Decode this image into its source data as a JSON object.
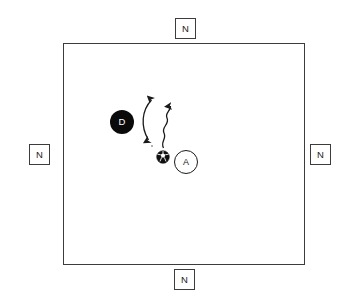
{
  "diagram": {
    "canvas": {
      "width": 346,
      "height": 308,
      "background": "#ffffff"
    },
    "field": {
      "label": "playing-area",
      "x": 63,
      "y": 43,
      "width": 242,
      "height": 222,
      "stroke": "#3c3c3c",
      "fill": "#ffffff"
    },
    "neutral_players": [
      {
        "label": "N",
        "position": "top",
        "x": 185,
        "y": 28
      },
      {
        "label": "N",
        "position": "left",
        "x": 39,
        "y": 154
      },
      {
        "label": "N",
        "position": "right",
        "x": 320,
        "y": 154
      },
      {
        "label": "N",
        "position": "bottom",
        "x": 184,
        "y": 279
      }
    ],
    "players": [
      {
        "label": "D",
        "role": "defender",
        "style": "filled-disc",
        "fill": "#0a0a0a",
        "text_color": "#ffffff",
        "x": 122,
        "y": 122,
        "radius": 12
      },
      {
        "label": "A",
        "role": "attacker",
        "style": "outlined-circle",
        "fill": "#ffffff",
        "text_color": "#1a1a1a",
        "x": 186,
        "y": 162,
        "radius": 12
      }
    ],
    "ball": {
      "name": "soccer-ball",
      "x": 163,
      "y": 157,
      "radius": 7,
      "fill": "#111111",
      "panel_color": "#ffffff"
    },
    "arrows": [
      {
        "name": "double-headed-curved-arrow",
        "meaning": "defender movement range",
        "style": "solid-curve",
        "heads": "both",
        "from": {
          "x": 147,
          "y": 145
        },
        "to": {
          "x": 153,
          "y": 96
        },
        "stroke": "#1a1a1a"
      },
      {
        "name": "wavy-dribble-arrow",
        "meaning": "ball dribble path",
        "style": "wavy",
        "heads": "end",
        "from": {
          "x": 164,
          "y": 150
        },
        "to": {
          "x": 172,
          "y": 103
        },
        "stroke": "#1a1a1a"
      }
    ],
    "marker_dot": {
      "name": "cone-marker",
      "x": 152,
      "y": 146,
      "color": "#9a9a9a"
    }
  }
}
